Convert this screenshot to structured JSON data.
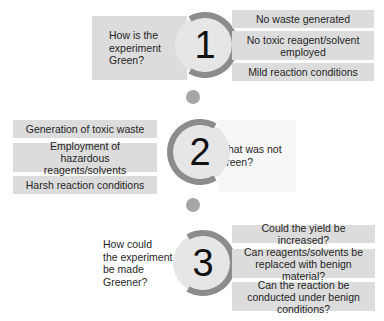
{
  "colors": {
    "box_fill": "#dcdcdc",
    "circle_fill": "#e6e6e6",
    "ring": "#8c8c8c",
    "dot": "#a6a6a6",
    "faint_box": "#f7f7f7",
    "text": "#1f1f1f"
  },
  "steps": [
    {
      "number": "1",
      "question": "How is the experiment Green?",
      "question_lines": [
        "How is the",
        "experiment",
        "Green?"
      ],
      "items": [
        "No waste generated",
        "No toxic reagent/solvent employed",
        "Mild reaction conditions"
      ]
    },
    {
      "number": "2",
      "question": "What was not Green?",
      "question_lines": [
        "What was not",
        "Green?"
      ],
      "items": [
        "Generation of toxic waste",
        "Employment of hazardous reagents/solvents",
        "Harsh reaction conditions"
      ]
    },
    {
      "number": "3",
      "question": "How could the experiment be made Greener?",
      "question_lines": [
        "How could",
        "the experiment",
        "be made",
        "Greener?"
      ],
      "items": [
        "Could the yield be increased?",
        "Can reagents/solvents be replaced with benign material?",
        "Can the reaction be conducted under benign conditions?"
      ]
    }
  ]
}
